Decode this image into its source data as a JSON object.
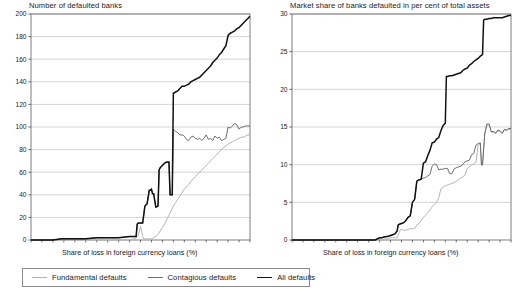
{
  "figure": {
    "width": 522,
    "height": 296,
    "background": "#ffffff"
  },
  "legend": {
    "items": [
      {
        "label": "Fundamental defaults",
        "color": "#b4b4b4",
        "width": 1.1,
        "swatch_name": "legend-swatch-fundamental"
      },
      {
        "label": "Contagious defaults",
        "color": "#6e6e6e",
        "width": 1.2,
        "swatch_name": "legend-swatch-contagious"
      },
      {
        "label": "All defaults",
        "color": "#111111",
        "width": 1.8,
        "swatch_name": "legend-swatch-all"
      }
    ]
  },
  "panels": {
    "left": {
      "title": "Number of defaulted banks",
      "xlabel": "Share of loss in foreign currency loans (%)",
      "ylabel": ""
    },
    "right": {
      "title": "Market share of banks defaulted in per cent of total assets",
      "xlabel": "Share of loss in foreign currency loans (%)",
      "ylabel": ""
    }
  },
  "chart_data": [
    {
      "id": "left",
      "type": "line",
      "title": "Number of defaulted banks",
      "xlabel": "Share of loss in foreign currency loans (%)",
      "ylabel": "Number of defaulted banks",
      "xlim": [
        0,
        100
      ],
      "ylim": [
        0,
        200
      ],
      "xticks": [
        0,
        5,
        10,
        15,
        20,
        25,
        30,
        35,
        40,
        45,
        50,
        55,
        60,
        65,
        70,
        75,
        80,
        85,
        90,
        95,
        100
      ],
      "yticks": [
        0,
        20,
        40,
        60,
        80,
        100,
        120,
        140,
        160,
        180,
        200
      ],
      "grid": "horizontal",
      "legend_position": "below-figure",
      "series": [
        {
          "name": "Fundamental defaults",
          "color": "#b4b4b4",
          "x": [
            0,
            10,
            15,
            20,
            25,
            30,
            35,
            40,
            45,
            47,
            48,
            49,
            49.5,
            50,
            50.5,
            51,
            51.5,
            52,
            53,
            54,
            55,
            56,
            57,
            58,
            59,
            60,
            61,
            62,
            63,
            64,
            65,
            66,
            67,
            68,
            69,
            70,
            71,
            72,
            73,
            74,
            75,
            76,
            77,
            78,
            79,
            80,
            81,
            82,
            83,
            84,
            85,
            86,
            87,
            88,
            89,
            90,
            91,
            92,
            93,
            94,
            95,
            96,
            97,
            98,
            99,
            100
          ],
          "y": [
            0,
            0,
            0,
            0,
            0,
            0,
            0,
            0,
            0,
            1,
            2,
            4,
            8,
            12,
            8,
            3,
            1,
            1,
            1,
            1,
            1,
            2,
            3,
            5,
            8,
            11,
            14,
            18,
            22,
            26,
            30,
            33,
            36,
            39,
            42,
            45,
            47,
            49,
            52,
            54,
            56,
            58,
            60,
            62,
            64,
            66,
            68,
            70,
            72,
            74,
            76,
            78,
            80,
            82,
            83,
            85,
            86,
            87,
            88,
            89,
            90,
            91,
            91,
            92,
            93,
            93
          ]
        },
        {
          "name": "Contagious defaults",
          "color": "#6e6e6e",
          "x": [
            0,
            10,
            14,
            15,
            20,
            25,
            30,
            35,
            40,
            45,
            48,
            48.5,
            49,
            49.5,
            50,
            51,
            52,
            53,
            54,
            54.5,
            55,
            55.5,
            56,
            57,
            58,
            58.5,
            59,
            60,
            61,
            62,
            63,
            63.5,
            64,
            64.5,
            65,
            65.5,
            66,
            67,
            68,
            69,
            70,
            71,
            72,
            73,
            74,
            75,
            76,
            77,
            78,
            79,
            80,
            81,
            82,
            83,
            84,
            85,
            86,
            87,
            88,
            89,
            90,
            91,
            92,
            93,
            94,
            95,
            96,
            97,
            98,
            99,
            100
          ],
          "y": [
            0,
            0,
            1,
            1,
            1,
            1,
            2,
            2,
            2,
            3,
            3,
            14,
            15,
            15,
            15,
            15,
            30,
            32,
            44,
            44,
            45,
            41,
            41,
            29,
            30,
            62,
            64,
            66,
            68,
            69,
            69,
            40,
            40,
            40,
            98,
            97,
            96,
            95,
            93,
            93,
            92,
            89,
            88,
            91,
            92,
            90,
            89,
            90,
            88,
            90,
            93,
            89,
            90,
            88,
            92,
            90,
            91,
            88,
            89,
            90,
            100,
            99,
            101,
            103,
            102,
            98,
            100,
            100,
            101,
            101,
            101
          ]
        },
        {
          "name": "All defaults",
          "color": "#111111",
          "x": [
            0,
            10,
            14,
            15,
            20,
            25,
            30,
            35,
            40,
            45,
            48,
            48.5,
            49,
            49.5,
            50,
            51,
            52,
            53,
            54,
            54.5,
            55,
            55.5,
            56,
            57,
            58,
            58.5,
            59,
            60,
            61,
            62,
            63,
            63.5,
            64,
            64.5,
            65,
            65.5,
            66,
            67,
            68,
            69,
            70,
            71,
            72,
            73,
            74,
            75,
            76,
            77,
            78,
            79,
            80,
            81,
            82,
            83,
            84,
            85,
            86,
            87,
            88,
            89,
            90,
            91,
            92,
            93,
            94,
            95,
            96,
            97,
            98,
            99,
            100
          ],
          "y": [
            0,
            0,
            1,
            1,
            1,
            1,
            2,
            2,
            2,
            3,
            3,
            14,
            15,
            15,
            15,
            15,
            30,
            32,
            44,
            44,
            45,
            41,
            41,
            29,
            30,
            62,
            64,
            66,
            68,
            69,
            69,
            40,
            40,
            40,
            130,
            130,
            131,
            132,
            134,
            136,
            136,
            137,
            138,
            140,
            141,
            142,
            143,
            144,
            146,
            148,
            150,
            152,
            154,
            157,
            159,
            161,
            164,
            166,
            169,
            172,
            181,
            183,
            184,
            185,
            187,
            188,
            190,
            192,
            194,
            196,
            198
          ]
        }
      ]
    },
    {
      "id": "right",
      "type": "line",
      "title": "Market share of banks defaulted in per cent of total assets",
      "xlabel": "Share of loss in foreign currency loans (%)",
      "ylabel": "Market share of banks defaulted in per cent of total assets",
      "xlim": [
        0,
        100
      ],
      "ylim": [
        0,
        30
      ],
      "xticks": [
        0,
        5,
        10,
        15,
        20,
        25,
        30,
        35,
        40,
        45,
        50,
        55,
        60,
        65,
        70,
        75,
        80,
        85,
        90,
        95,
        100
      ],
      "yticks": [
        0,
        5,
        10,
        15,
        20,
        25,
        30
      ],
      "grid": "horizontal",
      "legend_position": "below-figure",
      "series": [
        {
          "name": "Fundamental defaults",
          "color": "#b4b4b4",
          "x": [
            0,
            10,
            20,
            30,
            38,
            40,
            42,
            44,
            45,
            46,
            47,
            48,
            49,
            49.5,
            50,
            51,
            52,
            53,
            54,
            55,
            56,
            57,
            58,
            59,
            60,
            61,
            62,
            63,
            64,
            65,
            66,
            67,
            68,
            69,
            70,
            71,
            72,
            73,
            74,
            75,
            76,
            77,
            78,
            79,
            80,
            81,
            82,
            83,
            84,
            85,
            86,
            86.5,
            87,
            88,
            89,
            90,
            91,
            92,
            93,
            94,
            95,
            96,
            97,
            98,
            99,
            100
          ],
          "y": [
            0,
            0,
            0,
            0,
            0,
            0,
            0.1,
            0.2,
            0.3,
            0.3,
            0.3,
            0.3,
            1.0,
            1.4,
            1.4,
            1.3,
            1.3,
            1.4,
            1.5,
            1.5,
            1.5,
            2.0,
            2.2,
            2.6,
            3.0,
            3.3,
            3.6,
            4.0,
            4.4,
            4.7,
            5.0,
            5.6,
            6.8,
            7.0,
            7.2,
            7.3,
            7.4,
            7.5,
            7.6,
            7.8,
            8.0,
            8.2,
            8.4,
            8.6,
            9.5,
            9.7,
            10.0,
            10.1,
            10.3,
            12.6,
            12.8,
            9.9,
            9.9,
            14.0,
            15.3,
            15.3,
            14.3,
            14.3,
            14.1,
            14.5,
            14.4,
            14.1,
            14.6,
            14.5,
            14.7,
            14.7
          ]
        },
        {
          "name": "Contagious defaults",
          "color": "#6e6e6e",
          "x": [
            0,
            10,
            20,
            30,
            38,
            40,
            41,
            42,
            44,
            45,
            46,
            47,
            48,
            48.5,
            49,
            50,
            51,
            52,
            53,
            54,
            55,
            55.5,
            56,
            57,
            58,
            58.5,
            59,
            60,
            61,
            62,
            63,
            64,
            65,
            66,
            67,
            68,
            69,
            70,
            71,
            72,
            73,
            74,
            75,
            76,
            77,
            78,
            79,
            80,
            81,
            82,
            83,
            84,
            85,
            86,
            86.5,
            87,
            88,
            89,
            90,
            91,
            92,
            93,
            94,
            95,
            96,
            97,
            98,
            99,
            100
          ],
          "y": [
            0,
            0,
            0,
            0,
            0,
            0.3,
            0.3,
            0.4,
            0.5,
            0.6,
            0.7,
            0.8,
            1.2,
            2.0,
            2.1,
            2.2,
            2.3,
            2.6,
            3.0,
            3.2,
            5.0,
            5.2,
            5.4,
            7.8,
            8.0,
            8.0,
            8.1,
            8.2,
            8.3,
            8.5,
            8.7,
            9.8,
            10.1,
            10.0,
            9.3,
            9.4,
            9.4,
            9.5,
            9.5,
            8.8,
            8.8,
            9.4,
            9.6,
            9.7,
            9.8,
            10.0,
            10.4,
            10.5,
            10.6,
            11.3,
            11.5,
            12.6,
            12.8,
            12.9,
            10.0,
            10.0,
            14.1,
            15.4,
            15.4,
            14.4,
            14.4,
            14.2,
            14.6,
            14.5,
            14.2,
            14.7,
            14.6,
            14.8,
            14.8
          ]
        },
        {
          "name": "All defaults",
          "color": "#111111",
          "x": [
            0,
            10,
            20,
            30,
            38,
            40,
            41,
            42,
            44,
            45,
            46,
            47,
            48,
            48.5,
            49,
            50,
            51,
            52,
            53,
            54,
            55,
            55.5,
            56,
            57,
            58,
            58.5,
            59,
            60,
            61,
            62,
            63,
            64,
            65,
            66,
            67,
            68,
            69,
            70,
            70.5,
            71,
            72,
            73,
            74,
            75,
            76,
            77,
            78,
            79,
            80,
            81,
            82,
            83,
            84,
            85,
            86,
            87,
            87.5,
            88,
            89,
            90,
            91,
            92,
            93,
            94,
            95,
            96,
            97,
            98,
            99,
            100
          ],
          "y": [
            0,
            0,
            0,
            0,
            0,
            0.3,
            0.3,
            0.4,
            0.5,
            0.6,
            0.7,
            0.8,
            1.2,
            2.0,
            2.1,
            2.2,
            2.3,
            2.6,
            3.0,
            3.2,
            5.0,
            5.2,
            5.4,
            7.8,
            8.0,
            8.0,
            8.1,
            10.2,
            10.4,
            11.2,
            11.9,
            12.9,
            13.0,
            13.4,
            13.6,
            14.5,
            15.2,
            15.5,
            21.7,
            21.7,
            21.8,
            21.8,
            21.9,
            22.0,
            22.1,
            22.2,
            22.5,
            22.7,
            22.8,
            23.2,
            23.4,
            23.7,
            23.9,
            24.1,
            24.4,
            24.6,
            29.2,
            29.3,
            29.3,
            29.4,
            29.4,
            29.5,
            29.5,
            29.5,
            29.5,
            29.5,
            29.6,
            29.7,
            29.8,
            29.8
          ]
        }
      ]
    }
  ]
}
